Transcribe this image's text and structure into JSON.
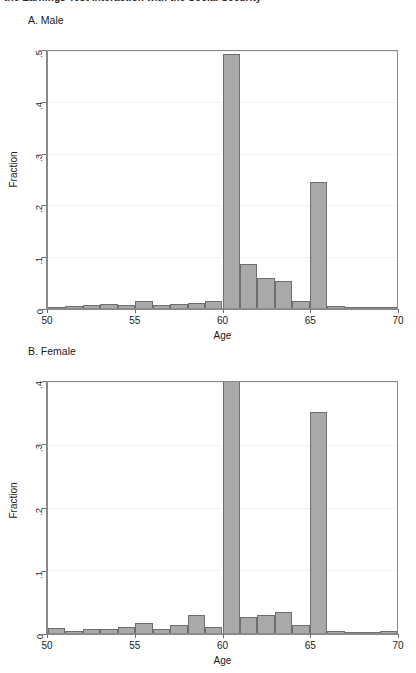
{
  "header": {
    "clipped_text": "the Earnings Test interaction with the Social Security"
  },
  "chart_data": [
    {
      "type": "bar",
      "id": "panel-a",
      "title": "A. Male",
      "xlabel": "Age",
      "ylabel": "Fraction",
      "xlim": [
        50,
        70
      ],
      "ylim": [
        0,
        0.5
      ],
      "xticks": [
        50,
        55,
        60,
        65,
        70
      ],
      "xtick_labels": [
        "50",
        "55",
        "60",
        "65",
        "70"
      ],
      "yticks": [
        0,
        0.1,
        0.2,
        0.3,
        0.4,
        0.5
      ],
      "ytick_labels": [
        "0",
        ".1",
        ".2",
        ".3",
        ".4",
        ".5"
      ],
      "grid": true,
      "bin_width": 1,
      "categories": [
        50,
        51,
        52,
        53,
        54,
        55,
        56,
        57,
        58,
        59,
        60,
        61,
        62,
        63,
        64,
        65,
        66,
        67,
        68,
        69
      ],
      "values": [
        0.002,
        0.004,
        0.005,
        0.007,
        0.005,
        0.013,
        0.005,
        0.008,
        0.009,
        0.013,
        0.495,
        0.085,
        0.059,
        0.053,
        0.014,
        0.245,
        0.004,
        0.001,
        0.0,
        0.001
      ]
    },
    {
      "type": "bar",
      "id": "panel-b",
      "title": "B. Female",
      "xlabel": "Age",
      "ylabel": "Fraction",
      "xlim": [
        50,
        70
      ],
      "ylim": [
        0,
        0.4
      ],
      "xticks": [
        50,
        55,
        60,
        65,
        70
      ],
      "xtick_labels": [
        "50",
        "55",
        "60",
        "65",
        "70"
      ],
      "yticks": [
        0,
        0.1,
        0.2,
        0.3,
        0.4
      ],
      "ytick_labels": [
        "0",
        ".1",
        ".2",
        ".3",
        ".4"
      ],
      "grid": true,
      "bin_width": 1,
      "categories": [
        50,
        51,
        52,
        53,
        54,
        55,
        56,
        57,
        58,
        59,
        60,
        61,
        62,
        63,
        64,
        65,
        66,
        67,
        68,
        69
      ],
      "values": [
        0.008,
        0.003,
        0.007,
        0.006,
        0.01,
        0.016,
        0.007,
        0.012,
        0.029,
        0.009,
        0.408,
        0.026,
        0.028,
        0.033,
        0.013,
        0.352,
        0.004,
        0.001,
        0.002,
        0.003
      ]
    }
  ],
  "style": {
    "bar_fill": "#a9a9a9",
    "bar_stroke": "#6e6e6e",
    "axis_color": "#8a8a8a",
    "grid_color": "#f1f1f1",
    "text_color": "#1a1a1a",
    "background": "#ffffff"
  }
}
